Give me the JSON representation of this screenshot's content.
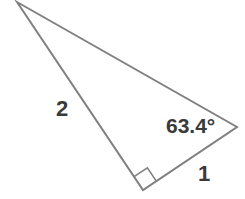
{
  "figure": {
    "name": "right-triangle",
    "background_color": "#ffffff",
    "stroke_color": "#808080",
    "text_color": "#3a3a3a",
    "stroke_width": 2
  },
  "vertices": {
    "apex": {
      "name": "A",
      "x": 17,
      "y": 2
    },
    "right_vertex": {
      "name": "B",
      "x": 237,
      "y": 127
    },
    "bottom_vertex": {
      "name": "C",
      "x": 143,
      "y": 190
    }
  },
  "labels": {
    "side_long": "2",
    "side_short": "1",
    "angle": "63.4°"
  },
  "right_angle_marker": {
    "name": "right-angle-square",
    "at_vertex": "bottom_vertex",
    "size": 16
  },
  "chart_data": {
    "type": "diagram",
    "title": "",
    "shape": "right triangle",
    "sides": [
      {
        "name": "hypotenuse",
        "from": "apex",
        "to": "right_vertex",
        "label": ""
      },
      {
        "name": "leg-long",
        "from": "apex",
        "to": "bottom_vertex",
        "label": "2"
      },
      {
        "name": "leg-short",
        "from": "bottom_vertex",
        "to": "right_vertex",
        "label": "1"
      }
    ],
    "angles": [
      {
        "at": "right_vertex",
        "label": "63.4°",
        "value": 63.4,
        "unit": "degrees"
      },
      {
        "at": "bottom_vertex",
        "label": "",
        "value": 90,
        "unit": "degrees",
        "marker": "square"
      }
    ]
  }
}
